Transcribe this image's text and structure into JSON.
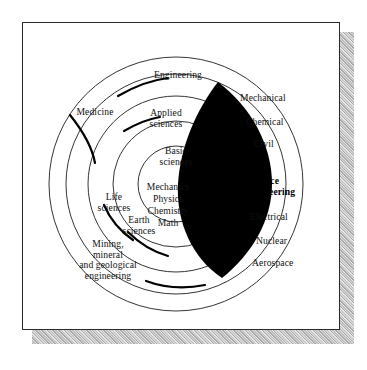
{
  "figure": {
    "type": "concentric-circle-diagram",
    "title": "",
    "background_color": "#ffffff",
    "plate_border_color": "#2b2b2b",
    "shadow_color": "#b4b4b4",
    "highlight_color": "#000000"
  },
  "rings": [
    {
      "name": "basic-sciences-ring",
      "radius": 38,
      "order": 1
    },
    {
      "name": "applied-sciences-ring",
      "radius": 63,
      "order": 2
    },
    {
      "name": "engineering-ring",
      "radius": 88,
      "order": 3
    },
    {
      "name": "medicine-ring",
      "radius": 110,
      "order": 4
    },
    {
      "name": "outer-ring",
      "radius": 127,
      "order": 5
    }
  ],
  "labels": {
    "engineering": "Engineering",
    "medicine": "Medicine",
    "applied_sciences": "Applied\nsciences",
    "basic_sciences": "Basic\nsciences",
    "life_sciences": "Life\nsciences",
    "earth_sciences": "Earth\nsciences",
    "mining": "Mining,\nmineral\nand geological\nengineering",
    "mechanics": "Mechanics",
    "physics": "Physics",
    "chemistry": "Chemistry",
    "math": "Math",
    "mechanical": "Mechanical",
    "chemical": "Chemical",
    "civil": "Civil",
    "electrical": "Electrical",
    "nuclear": "Nuclear",
    "aerospace": "Aerospace",
    "highlight_line1": "Science",
    "highlight_line2": "Engineering"
  }
}
